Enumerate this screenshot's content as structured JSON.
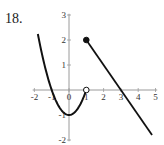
{
  "problem": {
    "number": "18."
  },
  "chart_data": {
    "type": "line",
    "title": "",
    "xlabel": "",
    "ylabel": "",
    "xlim": [
      -2,
      5
    ],
    "ylim": [
      -2,
      3
    ],
    "x_ticks": [
      "-2",
      "-1",
      "0",
      "1",
      "2",
      "3",
      "4",
      "5"
    ],
    "y_ticks": [
      "3",
      "2",
      "1",
      "-1",
      "-2"
    ],
    "grid": false,
    "legend": null,
    "series": [
      {
        "name": "piece-1 (parabola y = x^2 - 1)",
        "x": [
          -1.8,
          -1.5,
          -1,
          -0.5,
          0,
          0.5,
          1
        ],
        "y": [
          2.24,
          1.25,
          0,
          -0.75,
          -1,
          -0.75,
          0
        ],
        "endpoint": {
          "x": 1,
          "y": 0,
          "style": "open"
        }
      },
      {
        "name": "piece-2 (line y = -x + 3)",
        "x": [
          1,
          2,
          3,
          4,
          4.8
        ],
        "y": [
          2,
          1,
          0,
          -1,
          -1.8
        ],
        "endpoint": {
          "x": 1,
          "y": 2,
          "style": "closed"
        }
      }
    ],
    "colors": {
      "curve": "#111111",
      "axis": "#9a9a9a",
      "label": "#333333"
    }
  }
}
